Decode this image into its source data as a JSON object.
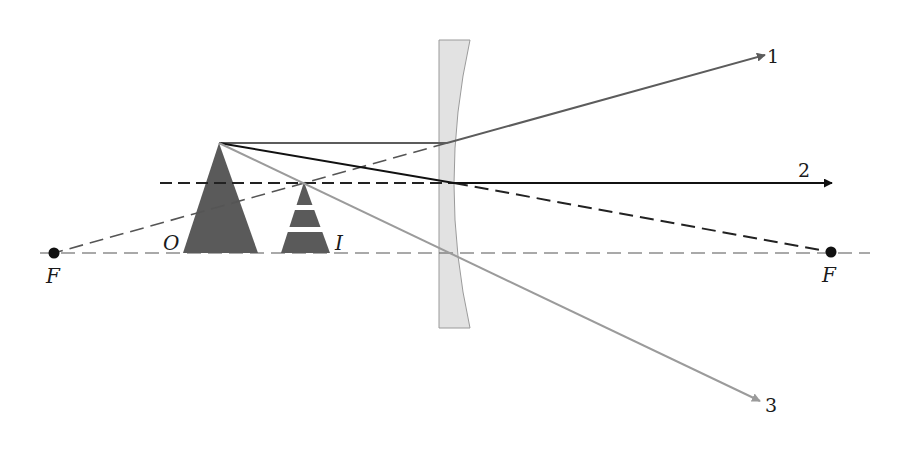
{
  "diagram": {
    "type": "ray-diagram",
    "labels": {
      "object": "O",
      "image": "I",
      "focal_left": "F",
      "focal_right": "F",
      "ray1": "1",
      "ray2": "2",
      "ray3": "3"
    },
    "colors": {
      "object_fill": "#5a5a5a",
      "image_fill": "#5a5a5a",
      "lens_fill": "#e2e2e2",
      "lens_stroke": "#9a9a9a",
      "ray1": "#5c5c5c",
      "ray2": "#111111",
      "ray3": "#9b9b9b",
      "axis": "#555555",
      "construction_dashed": "#222222",
      "focal_point": "#111111"
    },
    "elements": {
      "optical_axis": {
        "y": 253,
        "x1": 40,
        "x2": 870,
        "style": "dashed"
      },
      "lens": {
        "x_left": 439,
        "x_right_edge": 470,
        "x_right_mid": 453,
        "y_top": 40,
        "y_bottom": 328
      },
      "object": {
        "apex": [
          219,
          143
        ],
        "base": [
          183,
          258
        ],
        "base_y": 253
      },
      "image": {
        "apex": [
          304,
          182
        ],
        "base": [
          281,
          330
        ],
        "base_y": 253,
        "bands_y": [
          208,
          230
        ]
      },
      "focal_points": [
        [
          54,
          253
        ],
        [
          831,
          252
        ]
      ],
      "image_height_line": {
        "y": 183,
        "x1": 160,
        "x2": 454,
        "style": "dashed"
      },
      "rays": [
        {
          "id": "1",
          "path": [
            [
              219,
              143
            ],
            [
              447,
              143
            ],
            [
              765,
              55
            ]
          ],
          "extension_dashed": [
            [
              447,
              143
            ],
            [
              54,
              253
            ]
          ]
        },
        {
          "id": "2",
          "path": [
            [
              219,
              143
            ],
            [
              454,
              183
            ],
            [
              832,
              183
            ]
          ],
          "extension_dashed": [
            [
              454,
              183
            ],
            [
              831,
              252
            ]
          ]
        },
        {
          "id": "3",
          "path": [
            [
              219,
              143
            ],
            [
              760,
              401
            ]
          ]
        }
      ]
    }
  }
}
